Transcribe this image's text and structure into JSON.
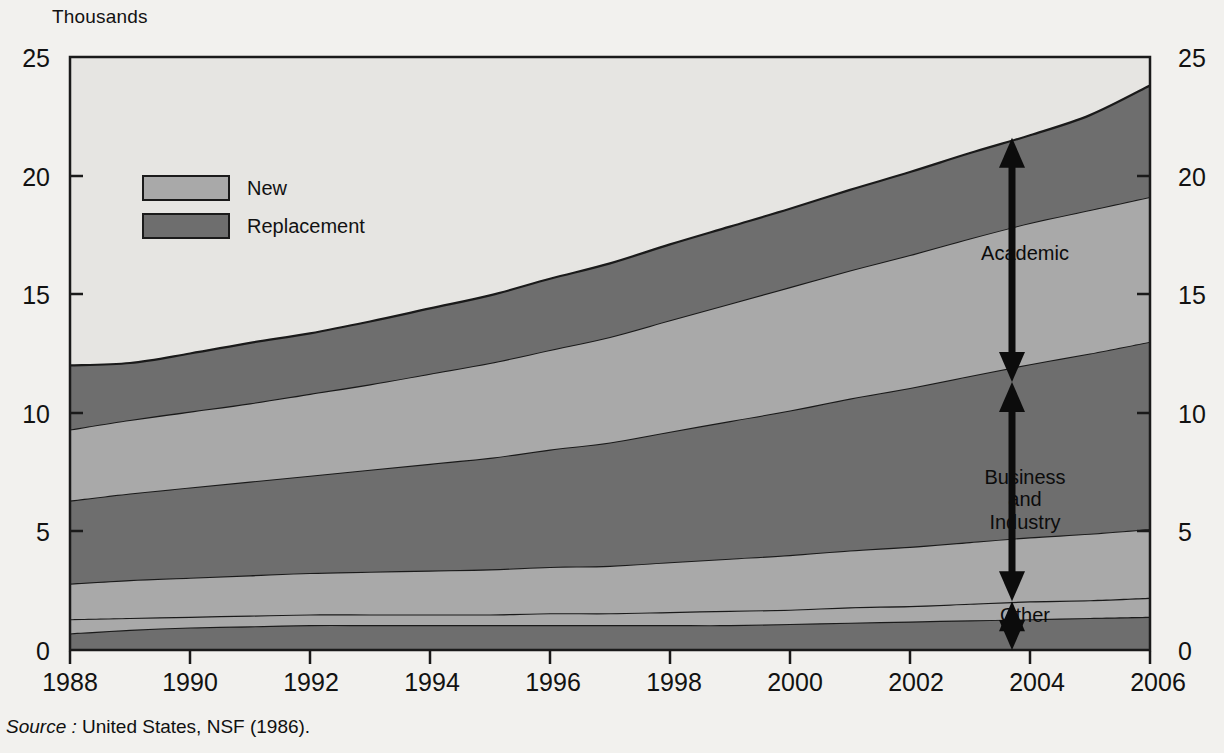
{
  "axis": {
    "y_unit_label": "Thousands",
    "y_ticks": [
      "0",
      "5",
      "10",
      "15",
      "20",
      "25"
    ],
    "y_ticks_right": [
      "0",
      "5",
      "10",
      "15",
      "20",
      "25"
    ],
    "x_ticks": [
      "1988",
      "1990",
      "1992",
      "1994",
      "1996",
      "1998",
      "2000",
      "2002",
      "2004",
      "2006"
    ]
  },
  "legend": {
    "items": [
      {
        "label": "New",
        "color": "#a9a9a9"
      },
      {
        "label": "Replacement",
        "color": "#6e6e6e"
      }
    ]
  },
  "annotations": {
    "academic": "Academic",
    "business_line1": "Business",
    "business_line2": "and",
    "business_line3": "Industry",
    "other": "Other"
  },
  "source": {
    "keyword": "Source :",
    "text": "United States, NSF  (1986)."
  },
  "colors": {
    "new": "#a9a9a9",
    "replacement": "#6e6e6e",
    "background_top": "#e6e5e2",
    "page": "#f2f1ee",
    "line": "#1a1a1a"
  },
  "chart_data": {
    "type": "area",
    "title": "",
    "subtitle": "",
    "xlabel": "",
    "ylabel": "Thousands",
    "xlim": [
      1988,
      2006
    ],
    "ylim": [
      0,
      25
    ],
    "grid": false,
    "legend_position": "upper-left",
    "stacking": "stacked",
    "stack_order_bottom_to_top": [
      "Other Replacement",
      "Other New",
      "Business and Industry New",
      "Business and Industry Replacement",
      "Academic New",
      "Academic Replacement"
    ],
    "x": [
      1988,
      1989,
      1990,
      1991,
      1992,
      1993,
      1994,
      1995,
      1996,
      1997,
      1998,
      1999,
      2000,
      2001,
      2002,
      2003,
      2004,
      2005,
      2006
    ],
    "series": [
      {
        "name": "Other Replacement",
        "color": "#6e6e6e",
        "values": [
          0.7,
          0.85,
          0.95,
          1.0,
          1.05,
          1.05,
          1.05,
          1.05,
          1.05,
          1.05,
          1.05,
          1.05,
          1.1,
          1.15,
          1.2,
          1.25,
          1.3,
          1.35,
          1.4
        ]
      },
      {
        "name": "Other New",
        "color": "#a9a9a9",
        "values": [
          0.6,
          0.5,
          0.45,
          0.45,
          0.45,
          0.45,
          0.45,
          0.45,
          0.5,
          0.5,
          0.55,
          0.6,
          0.6,
          0.65,
          0.65,
          0.7,
          0.75,
          0.75,
          0.8
        ]
      },
      {
        "name": "Business and Industry New",
        "color": "#a9a9a9",
        "values": [
          1.5,
          1.6,
          1.65,
          1.7,
          1.75,
          1.8,
          1.85,
          1.9,
          1.95,
          2.0,
          2.1,
          2.2,
          2.3,
          2.4,
          2.5,
          2.6,
          2.7,
          2.8,
          2.9
        ]
      },
      {
        "name": "Business and Industry Replacement",
        "color": "#6e6e6e",
        "values": [
          3.5,
          3.65,
          3.8,
          3.95,
          4.1,
          4.3,
          4.5,
          4.7,
          4.95,
          5.2,
          5.5,
          5.8,
          6.1,
          6.4,
          6.7,
          7.0,
          7.3,
          7.6,
          7.9
        ]
      },
      {
        "name": "Academic New",
        "color": "#a9a9a9",
        "values": [
          3.0,
          3.1,
          3.2,
          3.3,
          3.45,
          3.6,
          3.8,
          4.0,
          4.2,
          4.45,
          4.7,
          4.95,
          5.2,
          5.4,
          5.6,
          5.8,
          5.95,
          6.05,
          6.1
        ]
      },
      {
        "name": "Academic Replacement",
        "color": "#6e6e6e",
        "values": [
          2.7,
          2.4,
          2.45,
          2.55,
          2.55,
          2.65,
          2.75,
          2.85,
          3.0,
          3.1,
          3.2,
          3.25,
          3.3,
          3.4,
          3.5,
          3.6,
          3.7,
          4.0,
          4.7
        ]
      }
    ],
    "totals": [
      12.0,
      12.1,
      12.5,
      12.95,
      13.35,
      13.85,
      14.4,
      14.95,
      15.65,
      16.3,
      17.1,
      17.85,
      18.6,
      19.4,
      20.15,
      20.95,
      21.7,
      22.55,
      23.8
    ],
    "annotations": [
      {
        "label": "Academic",
        "x": 2003.7,
        "span_y": [
          11.3,
          21.6
        ],
        "style": "double-arrow"
      },
      {
        "label": "Business and Industry",
        "x": 2003.7,
        "span_y": [
          2.05,
          11.3
        ],
        "style": "double-arrow"
      },
      {
        "label": "Other",
        "x": 2003.7,
        "span_y": [
          0.0,
          2.05
        ],
        "style": "double-arrow"
      }
    ]
  }
}
